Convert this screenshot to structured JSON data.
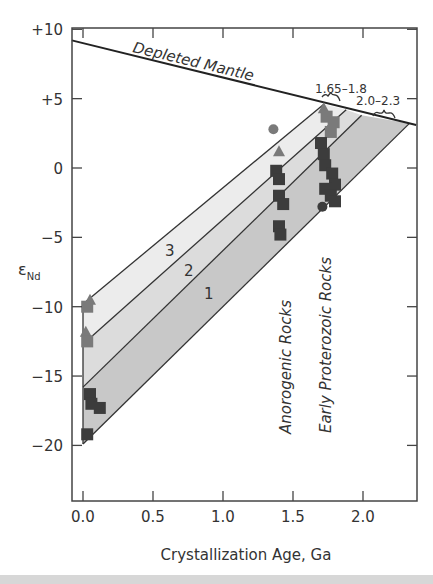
{
  "chart_data": {
    "type": "scatter",
    "title": "",
    "xlabel": "Crystallization Age, Ga",
    "ylabel": "εNd",
    "ylabel_main": "ε",
    "ylabel_sub": "Nd",
    "xlim": [
      -0.08,
      2.38
    ],
    "ylim": [
      -23.9,
      10
    ],
    "x_ticks": [
      0.0,
      0.5,
      1.0,
      1.5,
      2.0
    ],
    "x_tick_labels": [
      "0.0",
      "0.5",
      "1.0",
      "1.5",
      "2.0"
    ],
    "y_ticks": [
      10,
      5,
      0,
      -5,
      -10,
      -15,
      -20
    ],
    "y_tick_labels": [
      "+10",
      "+5",
      "0",
      "−10",
      "−15",
      "−20"
    ],
    "y_tick_labels_all": [
      "+10",
      "+5",
      "0",
      "−5",
      "−10",
      "−15",
      "−20"
    ],
    "grid": false,
    "depleted_mantle": {
      "label": "Depleted Mantle",
      "points": [
        [
          -0.08,
          9.2
        ],
        [
          2.38,
          3.1
        ]
      ]
    },
    "evolution_bands": [
      {
        "label": "3",
        "from": [
          0.0,
          -9.8
        ],
        "to": [
          1.72,
          4.6
        ]
      },
      {
        "label": "2",
        "from": [
          0.0,
          -12.7
        ],
        "to": [
          1.88,
          4.2
        ]
      },
      {
        "label": "1",
        "from": [
          0.0,
          -15.8
        ],
        "to": [
          1.99,
          3.8
        ]
      },
      {
        "label": "",
        "from": [
          0.0,
          -19.9
        ],
        "to": [
          2.33,
          3.2
        ]
      }
    ],
    "band_fill_colors": [
      "#ececec",
      "#dcdcdc",
      "#c8c8c8"
    ],
    "annotations": [
      {
        "text": "1.65–1.8",
        "x": 1.72,
        "y": 5.5
      },
      {
        "text": "2.0–2.3",
        "x": 2.1,
        "y": 4.4
      },
      {
        "text": "Anorogenic Rocks",
        "x": 1.45,
        "y": -14.3,
        "rotation": -90
      },
      {
        "text": "Early Proterozoic Rocks",
        "x": 1.74,
        "y": -12.9,
        "rotation": -90
      }
    ],
    "series": [
      {
        "name": "Young rocks (~0.05 Ga)",
        "points": [
          {
            "x": 0.05,
            "y": -9.5,
            "shape": "triangle",
            "color": "#7a7a7a"
          },
          {
            "x": 0.03,
            "y": -10.0,
            "shape": "square",
            "color": "#7a7a7a"
          },
          {
            "x": 0.02,
            "y": -11.8,
            "shape": "triangle",
            "color": "#7a7a7a"
          },
          {
            "x": 0.03,
            "y": -12.5,
            "shape": "square",
            "color": "#7a7a7a"
          },
          {
            "x": 0.05,
            "y": -16.3,
            "shape": "square",
            "color": "#3c3c3c"
          },
          {
            "x": 0.06,
            "y": -17.0,
            "shape": "square",
            "color": "#3c3c3c"
          },
          {
            "x": 0.12,
            "y": -17.3,
            "shape": "square",
            "color": "#3c3c3c"
          },
          {
            "x": 0.03,
            "y": -19.2,
            "shape": "square",
            "color": "#3c3c3c"
          }
        ]
      },
      {
        "name": "Anorogenic Rocks (~1.4 Ga)",
        "points": [
          {
            "x": 1.36,
            "y": 2.8,
            "shape": "circle",
            "color": "#7a7a7a"
          },
          {
            "x": 1.4,
            "y": 1.2,
            "shape": "triangle",
            "color": "#7a7a7a"
          },
          {
            "x": 1.38,
            "y": -0.2,
            "shape": "square",
            "color": "#3c3c3c"
          },
          {
            "x": 1.4,
            "y": -0.8,
            "shape": "square",
            "color": "#3c3c3c"
          },
          {
            "x": 1.4,
            "y": -2.0,
            "shape": "square",
            "color": "#3c3c3c"
          },
          {
            "x": 1.43,
            "y": -2.6,
            "shape": "square",
            "color": "#3c3c3c"
          },
          {
            "x": 1.4,
            "y": -4.2,
            "shape": "square",
            "color": "#3c3c3c"
          },
          {
            "x": 1.41,
            "y": -4.8,
            "shape": "square",
            "color": "#3c3c3c"
          }
        ]
      },
      {
        "name": "Early Proterozoic Rocks (~1.75 Ga)",
        "points": [
          {
            "x": 1.72,
            "y": 4.3,
            "shape": "triangle",
            "color": "#7a7a7a"
          },
          {
            "x": 1.74,
            "y": 3.7,
            "shape": "square",
            "color": "#7a7a7a"
          },
          {
            "x": 1.79,
            "y": 3.3,
            "shape": "square",
            "color": "#7a7a7a"
          },
          {
            "x": 1.77,
            "y": 2.6,
            "shape": "square",
            "color": "#7a7a7a"
          },
          {
            "x": 1.7,
            "y": 1.8,
            "shape": "square",
            "color": "#3c3c3c"
          },
          {
            "x": 1.72,
            "y": 1.0,
            "shape": "square",
            "color": "#3c3c3c"
          },
          {
            "x": 1.73,
            "y": 0.2,
            "shape": "square",
            "color": "#3c3c3c"
          },
          {
            "x": 1.78,
            "y": -0.4,
            "shape": "square",
            "color": "#3c3c3c"
          },
          {
            "x": 1.8,
            "y": -1.2,
            "shape": "square",
            "color": "#3c3c3c"
          },
          {
            "x": 1.73,
            "y": -1.5,
            "shape": "square",
            "color": "#3c3c3c"
          },
          {
            "x": 1.77,
            "y": -2.0,
            "shape": "square",
            "color": "#3c3c3c"
          },
          {
            "x": 1.8,
            "y": -2.4,
            "shape": "square",
            "color": "#3c3c3c"
          },
          {
            "x": 1.71,
            "y": -2.8,
            "shape": "circle",
            "color": "#3c3c3c"
          }
        ]
      }
    ]
  },
  "layout": {
    "plot_left": 72,
    "plot_right": 417,
    "plot_top": 28,
    "plot_bottom": 501,
    "x0_px": 83,
    "px_per_ga": 140,
    "y0_px": 168,
    "px_per_unit": 13.87
  },
  "labels": {
    "depleted_mantle": "Depleted Mantle",
    "range_1": "1.65–1.8",
    "range_2": "2.0–2.3",
    "band_3": "3",
    "band_2": "2",
    "band_1": "1",
    "anorogenic": "Anorogenic Rocks",
    "early_proterozoic": "Early Proterozoic Rocks",
    "xlabel": "Crystallization Age, Ga",
    "ylabel_main": "ε",
    "ylabel_sub": "Nd"
  }
}
